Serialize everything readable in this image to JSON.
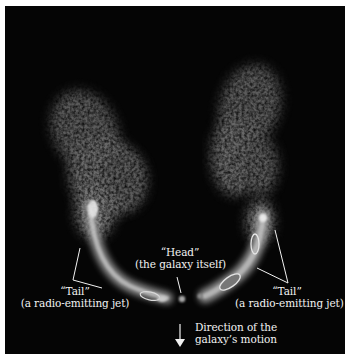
{
  "figure": {
    "background_color": "#050505",
    "emission_color": "#bdbdbd",
    "annotation_color": "#f2f2f2"
  },
  "labels": {
    "tail_left": {
      "title": "“Tail”",
      "subtitle": "(a radio-emitting jet)"
    },
    "tail_right": {
      "title": "“Tail”",
      "subtitle": "(a radio-emitting jet)"
    },
    "head": {
      "title": "“Head”",
      "subtitle": "(the galaxy itself)"
    },
    "direction": {
      "line1": "Direction of the",
      "line2": "galaxy’s motion"
    }
  },
  "icons": {
    "direction_arrow": "arrow-down-icon"
  }
}
